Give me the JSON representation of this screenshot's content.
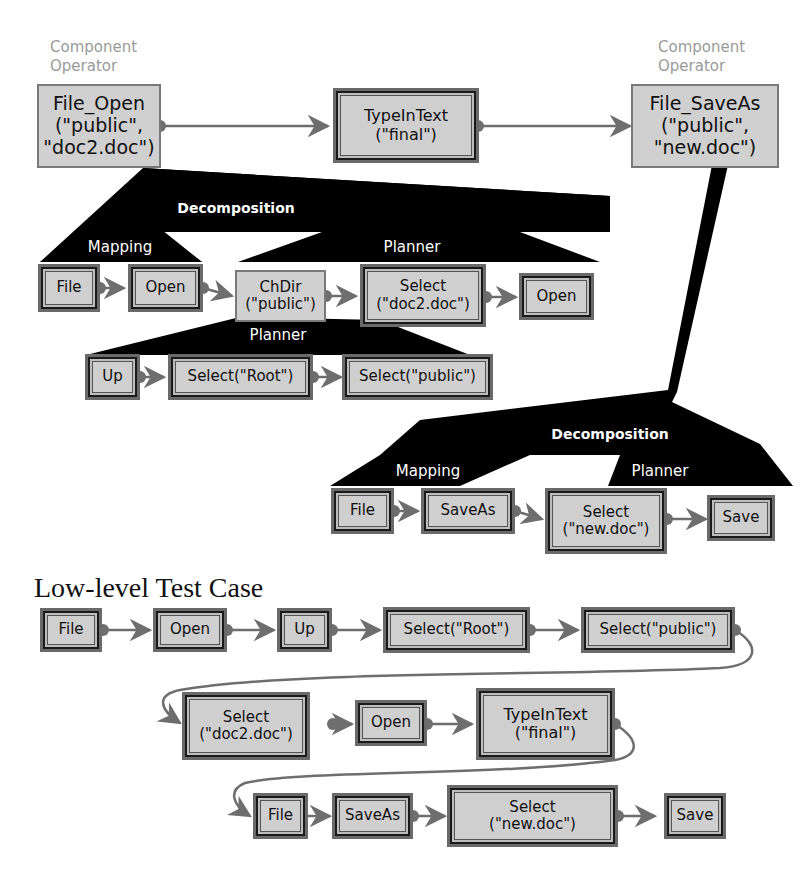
{
  "top_level": {
    "component_operator_label": "Component\nOperator",
    "left_component_label": "Component Operator",
    "right_component_label": "Component Operator",
    "nodes": [
      {
        "id": "file_open",
        "type": "component",
        "text": "File_Open\n(\"public\",\n\"doc2.doc\")"
      },
      {
        "id": "typeintext",
        "type": "event",
        "text": "TypeInText\n(\"final\")"
      },
      {
        "id": "file_saveas",
        "type": "component",
        "text": "File_SaveAs\n(\"public\",\n\"new.doc\")"
      }
    ]
  },
  "file_open_decomposition": {
    "label": "Decomposition",
    "mapping_label": "Mapping",
    "planner_label": "Planner",
    "mapping_nodes": [
      "File",
      "Open"
    ],
    "planner_nodes": [
      "ChDir\n(\"public\")",
      "Select\n(\"doc2.doc\")",
      "Open"
    ],
    "chdir_planner": {
      "label": "Planner",
      "nodes": [
        "Up",
        "Select(\"Root\")",
        "Select(\"public\")"
      ]
    }
  },
  "file_saveas_decomposition": {
    "label": "Decomposition",
    "mapping_label": "Mapping",
    "planner_label": "Planner",
    "mapping_nodes": [
      "File",
      "SaveAs"
    ],
    "planner_nodes": [
      "Select\n(\"new.doc\")",
      "Save"
    ]
  },
  "low_level_test_case": {
    "title": "Low-level Test Case",
    "row1": [
      "File",
      "Open",
      "Up",
      "Select(\"Root\")",
      "Select(\"public\")"
    ],
    "row2": [
      "Select\n(\"doc2.doc\")",
      "Open",
      "TypeInText\n(\"final\")"
    ],
    "row3": [
      "File",
      "SaveAs",
      "Select\n(\"new.doc\")",
      "Save"
    ]
  },
  "caption": "",
  "colors": {
    "node_fill": "#cfcfcf",
    "edge": "#6e6e6e",
    "decomposition_fill": "#000000",
    "label_gray": "#9a9a9a"
  }
}
